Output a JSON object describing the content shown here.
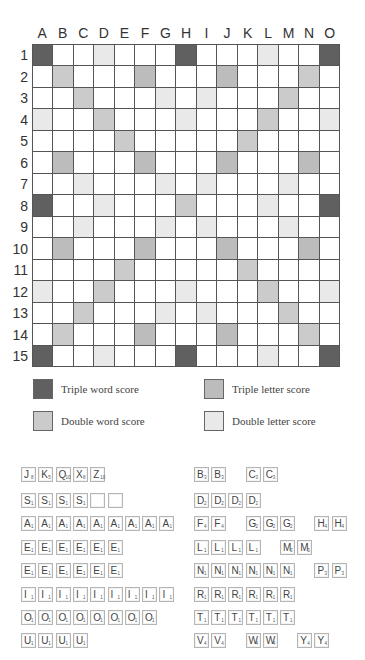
{
  "board": {
    "columns": [
      "A",
      "B",
      "C",
      "D",
      "E",
      "F",
      "G",
      "H",
      "I",
      "J",
      "K",
      "L",
      "M",
      "N",
      "O"
    ],
    "rows": [
      "1",
      "2",
      "3",
      "4",
      "5",
      "6",
      "7",
      "8",
      "9",
      "10",
      "11",
      "12",
      "13",
      "14",
      "15"
    ],
    "layout": [
      "TW . . DL . . . TW . . . DL . . TW",
      ". DW . . . TL . . . TL . . . DW .",
      ". . DW . . . DL . DL . . . DW . .",
      "DL . . DW . . . DL . . . DW . . DL",
      ". . . . DW . . . . . DW . . . .",
      ". TL . . . TL . . . TL . . . TL .",
      ". . DL . . . DL . DL . . . DL . .",
      "TW . . DL . . . DW . . . DL . . TW",
      ". . DL . . . DL . DL . . . DL . .",
      ". TL . . . TL . . . TL . . . TL .",
      ". . . . DW . . . . . DW . . . .",
      "DL . . DW . . . DL . . . DW . . DL",
      ". . DW . . . DL . DL . . . DW . .",
      ". DW . . . TL . . . TL . . . DW .",
      "TW . . DL . . . TW . . . DL . . TW"
    ],
    "colors": {
      "TW": "#606060",
      "DW": "#cbcbcb",
      "TL": "#bcbcbc",
      "DL": "#e9e9e9",
      "plain": "#ffffff"
    }
  },
  "legend": [
    {
      "key": "TW",
      "label": "Triple word score"
    },
    {
      "key": "TL",
      "label": "Triple letter score"
    },
    {
      "key": "DW",
      "label": "Double word score"
    },
    {
      "key": "DL",
      "label": "Double letter score"
    }
  ],
  "tiles": {
    "left": [
      [
        [
          "J",
          "8"
        ],
        [
          "K",
          "5"
        ],
        [
          "Q",
          "10"
        ],
        [
          "X",
          "8"
        ],
        [
          "Z",
          "10"
        ]
      ],
      [
        [
          "S",
          "1"
        ],
        [
          "S",
          "1"
        ],
        [
          "S",
          "1"
        ],
        [
          "S",
          "1"
        ],
        [
          "",
          ""
        ],
        [
          "",
          ""
        ]
      ],
      [
        [
          "A",
          "1"
        ],
        [
          "A",
          "1"
        ],
        [
          "A",
          "1"
        ],
        [
          "A",
          "1"
        ],
        [
          "A",
          "1"
        ],
        [
          "A",
          "1"
        ],
        [
          "A",
          "1"
        ],
        [
          "A",
          "1"
        ],
        [
          "A",
          "1"
        ]
      ],
      [
        [
          "E",
          "1"
        ],
        [
          "E",
          "1"
        ],
        [
          "E",
          "1"
        ],
        [
          "E",
          "1"
        ],
        [
          "E",
          "1"
        ],
        [
          "E",
          "1"
        ]
      ],
      [
        [
          "E",
          "1"
        ],
        [
          "E",
          "1"
        ],
        [
          "E",
          "1"
        ],
        [
          "E",
          "1"
        ],
        [
          "E",
          "1"
        ],
        [
          "E",
          "1"
        ]
      ],
      [
        [
          "I",
          "1"
        ],
        [
          "I",
          "1"
        ],
        [
          "I",
          "1"
        ],
        [
          "I",
          "1"
        ],
        [
          "I",
          "1"
        ],
        [
          "I",
          "1"
        ],
        [
          "I",
          "1"
        ],
        [
          "I",
          "1"
        ],
        [
          "I",
          "1"
        ]
      ],
      [
        [
          "O",
          "1"
        ],
        [
          "O",
          "1"
        ],
        [
          "O",
          "1"
        ],
        [
          "O",
          "1"
        ],
        [
          "O",
          "1"
        ],
        [
          "O",
          "1"
        ],
        [
          "O",
          "1"
        ],
        [
          "O",
          "1"
        ]
      ],
      [
        [
          "U",
          "1"
        ],
        [
          "U",
          "1"
        ],
        [
          "U",
          "1"
        ],
        [
          "U",
          "1"
        ]
      ]
    ],
    "right": [
      [
        [
          0,
          "B",
          "3"
        ],
        [
          1,
          "B",
          "3"
        ],
        [
          3,
          "C",
          "3"
        ],
        [
          4,
          "C",
          "3"
        ]
      ],
      [
        [
          0,
          "D",
          "2"
        ],
        [
          1,
          "D",
          "2"
        ],
        [
          2,
          "D",
          "2"
        ],
        [
          3,
          "D",
          "2"
        ]
      ],
      [
        [
          0,
          "F",
          "4"
        ],
        [
          1,
          "F",
          "4"
        ],
        [
          3,
          "G",
          "2"
        ],
        [
          4,
          "G",
          "2"
        ],
        [
          5,
          "G",
          "2"
        ],
        [
          7,
          "H",
          "4"
        ],
        [
          8,
          "H",
          "4"
        ]
      ],
      [
        [
          0,
          "L",
          "1"
        ],
        [
          1,
          "L",
          "1"
        ],
        [
          2,
          "L",
          "1"
        ],
        [
          3,
          "L",
          "1"
        ],
        [
          5,
          "M",
          "3"
        ],
        [
          6,
          "M",
          "3"
        ]
      ],
      [
        [
          0,
          "N",
          "1"
        ],
        [
          1,
          "N",
          "1"
        ],
        [
          2,
          "N",
          "1"
        ],
        [
          3,
          "N",
          "1"
        ],
        [
          4,
          "N",
          "1"
        ],
        [
          5,
          "N",
          "1"
        ],
        [
          7,
          "P",
          "3"
        ],
        [
          8,
          "P",
          "3"
        ]
      ],
      [
        [
          0,
          "R",
          "1"
        ],
        [
          1,
          "R",
          "1"
        ],
        [
          2,
          "R",
          "1"
        ],
        [
          3,
          "R",
          "1"
        ],
        [
          4,
          "R",
          "1"
        ],
        [
          5,
          "R",
          "1"
        ]
      ],
      [
        [
          0,
          "T",
          "1"
        ],
        [
          1,
          "T",
          "1"
        ],
        [
          2,
          "T",
          "1"
        ],
        [
          3,
          "T",
          "1"
        ],
        [
          4,
          "T",
          "1"
        ],
        [
          5,
          "T",
          "1"
        ]
      ],
      [
        [
          0,
          "V",
          "4"
        ],
        [
          1,
          "V",
          "4"
        ],
        [
          3,
          "W",
          "4"
        ],
        [
          4,
          "W",
          "4"
        ],
        [
          6,
          "Y",
          "4"
        ],
        [
          7,
          "Y",
          "4"
        ]
      ]
    ]
  }
}
